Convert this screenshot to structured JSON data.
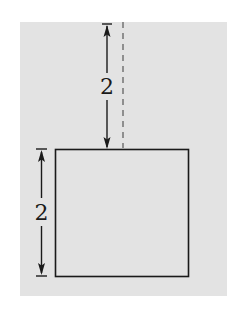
{
  "figure": {
    "background_color": "#e3e3e3",
    "line_color": "#1a1a1a",
    "dash_color": "#7a7a7a",
    "square": {
      "label": "square",
      "side_length": 2
    },
    "dimensions": {
      "gap_above_square": {
        "label": "2"
      },
      "square_side": {
        "label": "2"
      }
    },
    "dashed_line": {
      "label": "vertical reference line"
    }
  }
}
